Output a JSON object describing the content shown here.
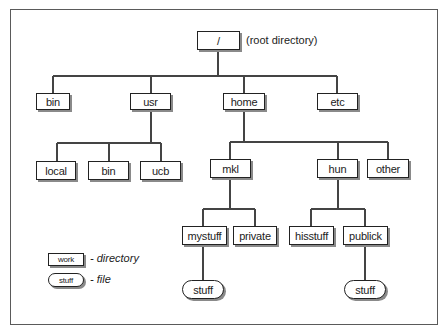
{
  "diagram": {
    "root": {
      "label": "/",
      "annotation": "(root directory)"
    },
    "level1": [
      {
        "id": "bin",
        "label": "bin"
      },
      {
        "id": "usr",
        "label": "usr"
      },
      {
        "id": "home",
        "label": "home"
      },
      {
        "id": "etc",
        "label": "etc"
      }
    ],
    "usr_children": [
      {
        "id": "local",
        "label": "local"
      },
      {
        "id": "usr-bin",
        "label": "bin"
      },
      {
        "id": "ucb",
        "label": "ucb"
      }
    ],
    "home_children": [
      {
        "id": "mkl",
        "label": "mkl"
      },
      {
        "id": "hun",
        "label": "hun"
      },
      {
        "id": "other",
        "label": "other"
      }
    ],
    "mkl_children": [
      {
        "id": "mystuff",
        "label": "mystuff"
      },
      {
        "id": "private",
        "label": "private"
      }
    ],
    "hun_children": [
      {
        "id": "hisstuff",
        "label": "hisstuff"
      },
      {
        "id": "publick",
        "label": "publick"
      }
    ],
    "files": [
      {
        "parent": "mystuff",
        "label": "stuff"
      },
      {
        "parent": "publick",
        "label": "stuff"
      }
    ],
    "legend": {
      "directory_example": "work",
      "directory_text": "- directory",
      "file_example": "stuff",
      "file_text": "- file"
    }
  }
}
